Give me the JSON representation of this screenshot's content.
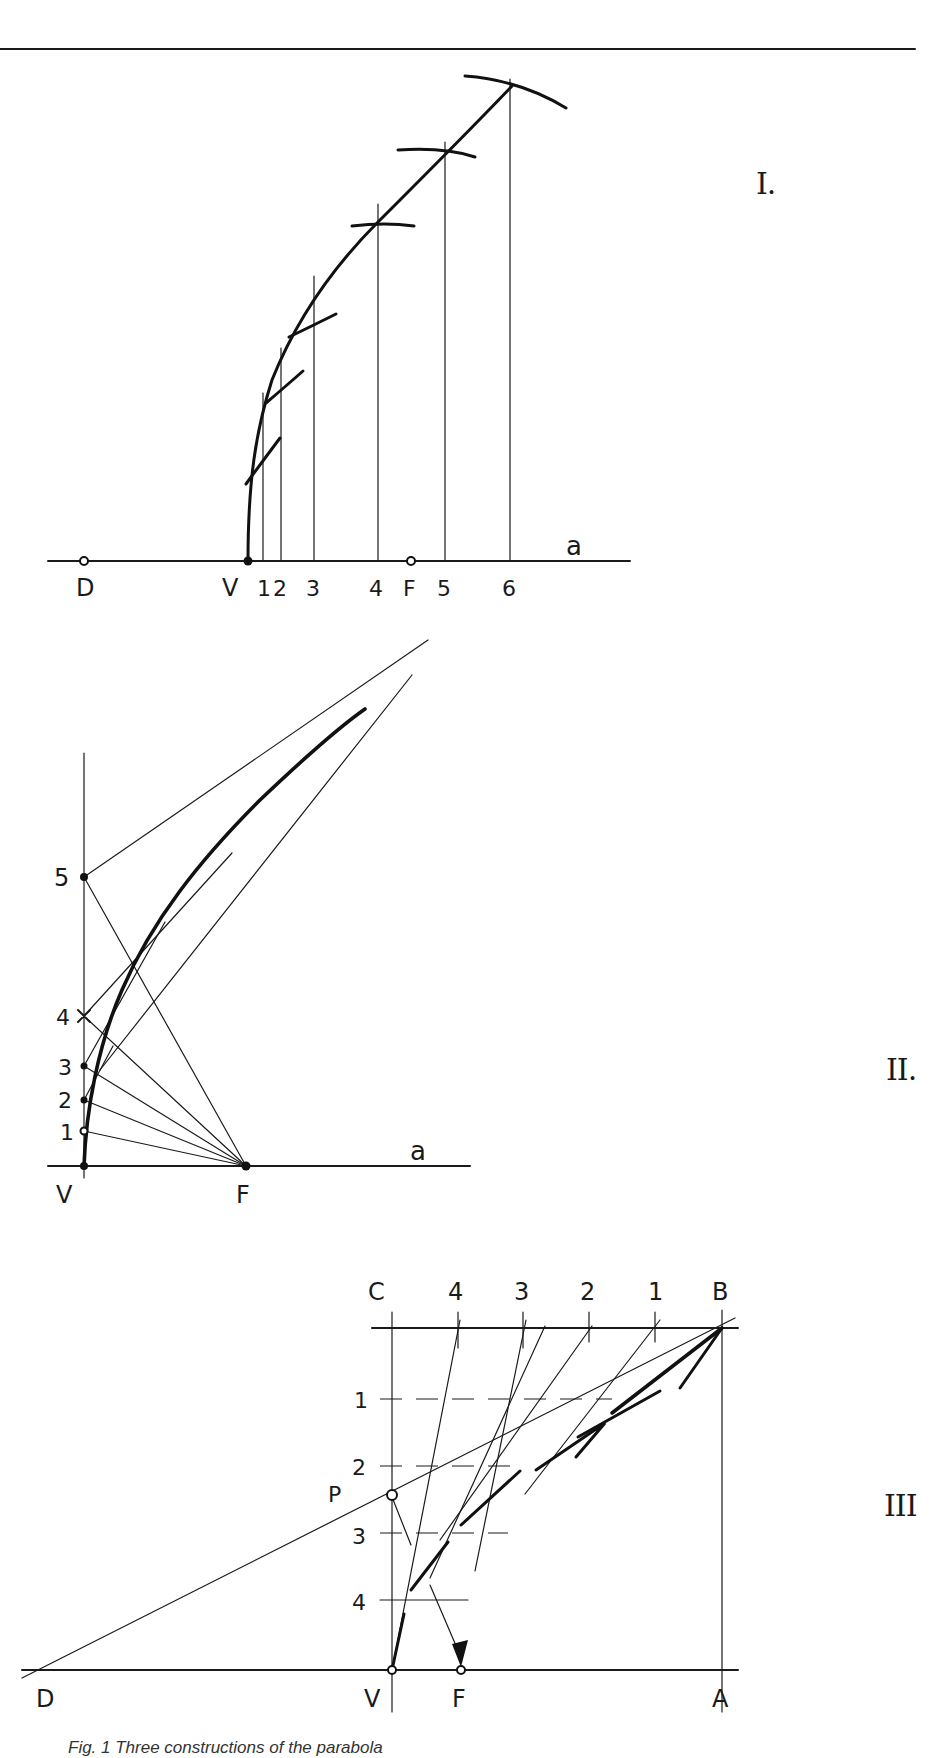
{
  "figures": [
    {
      "id": "I",
      "numeral": "I.",
      "axis_label": "a",
      "points": {
        "D": "D",
        "V": "V",
        "F": "F"
      },
      "ordinates": [
        "1",
        "2",
        "3",
        "4",
        "5",
        "6"
      ]
    },
    {
      "id": "II",
      "numeral": "II.",
      "axis_label": "a",
      "points": {
        "V": "V",
        "F": "F"
      },
      "axis_marks": [
        "1",
        "2",
        "3",
        "4",
        "5"
      ]
    },
    {
      "id": "III",
      "numeral": "III",
      "points": {
        "C": "C",
        "B": "B",
        "A": "A",
        "D": "D",
        "V": "V",
        "F": "F",
        "P": "P"
      },
      "top_marks": [
        "4",
        "3",
        "2",
        "1"
      ],
      "side_marks": [
        "1",
        "2",
        "3",
        "4"
      ]
    }
  ],
  "caption": "Fig. 1  Three constructions of the parabola"
}
